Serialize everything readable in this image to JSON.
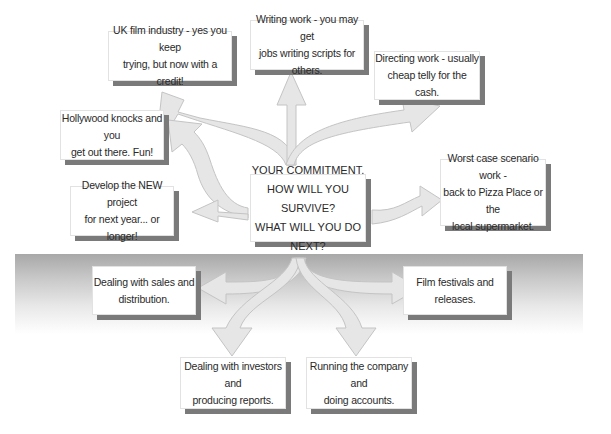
{
  "diagram": {
    "type": "radial-flow",
    "center": {
      "lines": [
        "YOUR COMMITMENT.",
        "HOW WILL YOU SURVIVE?",
        "WHAT WILL YOU DO NEXT?"
      ]
    },
    "upper_options": [
      {
        "id": "uk-film",
        "lines": [
          "UK film industry - yes you keep",
          "trying, but now with a credit!"
        ]
      },
      {
        "id": "writing",
        "lines": [
          "Writing work - you may get",
          "jobs writing scripts for others."
        ]
      },
      {
        "id": "directing",
        "lines": [
          "Directing work - usually",
          "cheap telly for the cash."
        ]
      },
      {
        "id": "hollywood",
        "lines": [
          "Hollywood knocks and you",
          "get out there. Fun!"
        ]
      },
      {
        "id": "new-project",
        "lines": [
          "Develop the NEW project",
          "for next year... or longer!"
        ]
      },
      {
        "id": "worst-case",
        "lines": [
          "Worst case scenario work -",
          "back to Pizza Place or the",
          "local supermarket."
        ]
      }
    ],
    "lower_options": [
      {
        "id": "sales",
        "lines": [
          "Dealing with sales and",
          "distribution."
        ]
      },
      {
        "id": "festivals",
        "lines": [
          "Film festivals and releases."
        ]
      },
      {
        "id": "investors",
        "lines": [
          "Dealing with investors and",
          "producing reports."
        ]
      },
      {
        "id": "running",
        "lines": [
          "Running the company and",
          "doing accounts."
        ]
      }
    ]
  },
  "colors": {
    "arrow_fill": "#e6e6e6",
    "arrow_stroke": "#c4c4c4",
    "box_shadow": "#7a7a7a",
    "band_top": "#a8a8a8"
  }
}
